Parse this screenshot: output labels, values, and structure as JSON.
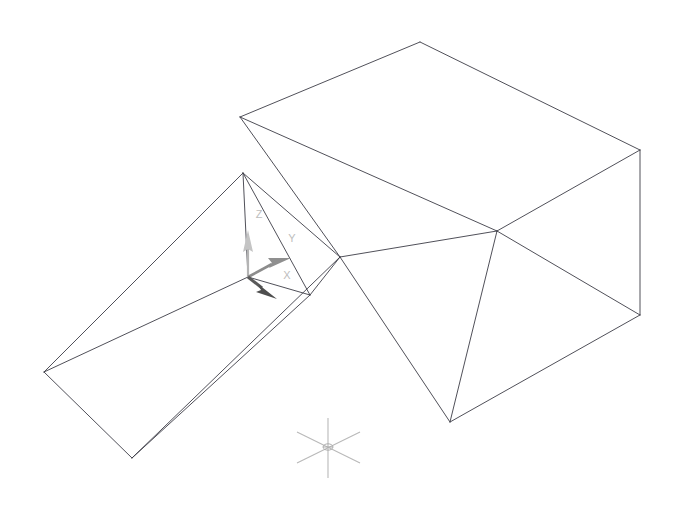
{
  "viewport": {
    "name": "cad-3d-wireframe-viewport",
    "width": 679,
    "height": 508,
    "background_color": "#ffffff",
    "projection": "isometric",
    "render_mode": "2D Wireframe",
    "edge_color": "#3c3c46"
  },
  "ucs_gizmo": {
    "name": "ucs-axis-triad",
    "origin": {
      "x": 248,
      "y": 277
    },
    "axes": [
      {
        "id": "z",
        "label": "Z",
        "color": "#b4b4b4",
        "head_color": "#c4c4c4",
        "tip": {
          "x": 248,
          "y": 232
        },
        "label_position": {
          "x": 259,
          "y": 215
        }
      },
      {
        "id": "y",
        "label": "Y",
        "color": "#8c8c8c",
        "head_color": "#8f8f8f",
        "tip": {
          "x": 288,
          "y": 261
        },
        "label_position": {
          "x": 292,
          "y": 239
        }
      },
      {
        "id": "x",
        "label": "X",
        "color": "#5a5a5a",
        "head_color": "#4e4e4e",
        "tip": {
          "x": 274,
          "y": 296
        },
        "label_position": {
          "x": 287,
          "y": 276
        }
      }
    ]
  },
  "axis_marker": {
    "name": "coordinate-star-marker",
    "center": {
      "x": 328,
      "y": 447
    },
    "color": "#b9b9b9",
    "ray_count": 6
  },
  "solids": [
    {
      "name": "open-top-rectangular-box",
      "type": "box",
      "edges": [
        [
          [
            240,
            117
          ],
          [
            420,
            42
          ]
        ],
        [
          [
            420,
            42
          ],
          [
            640,
            150
          ]
        ],
        [
          [
            640,
            150
          ],
          [
            497,
            231
          ]
        ],
        [
          [
            497,
            231
          ],
          [
            240,
            117
          ]
        ],
        [
          [
            240,
            117
          ],
          [
            340,
            257
          ]
        ],
        [
          [
            497,
            231
          ],
          [
            450,
            422
          ]
        ],
        [
          [
            640,
            150
          ],
          [
            640,
            315
          ]
        ],
        [
          [
            340,
            257
          ],
          [
            450,
            422
          ]
        ],
        [
          [
            450,
            422
          ],
          [
            640,
            315
          ]
        ],
        [
          [
            340,
            257
          ],
          [
            497,
            231
          ]
        ],
        [
          [
            497,
            231
          ],
          [
            640,
            315
          ]
        ]
      ]
    },
    {
      "name": "triangular-wedge-prism",
      "type": "wedge",
      "edges": [
        [
          [
            243,
            173
          ],
          [
            44,
            372
          ]
        ],
        [
          [
            44,
            372
          ],
          [
            132,
            458
          ]
        ],
        [
          [
            132,
            458
          ],
          [
            310,
            295
          ]
        ],
        [
          [
            310,
            295
          ],
          [
            243,
            173
          ]
        ],
        [
          [
            243,
            173
          ],
          [
            340,
            257
          ]
        ],
        [
          [
            340,
            257
          ],
          [
            310,
            295
          ]
        ],
        [
          [
            132,
            458
          ],
          [
            340,
            257
          ]
        ],
        [
          [
            243,
            173
          ],
          [
            248,
            277
          ]
        ],
        [
          [
            248,
            277
          ],
          [
            44,
            372
          ]
        ],
        [
          [
            248,
            277
          ],
          [
            310,
            295
          ]
        ]
      ]
    }
  ]
}
